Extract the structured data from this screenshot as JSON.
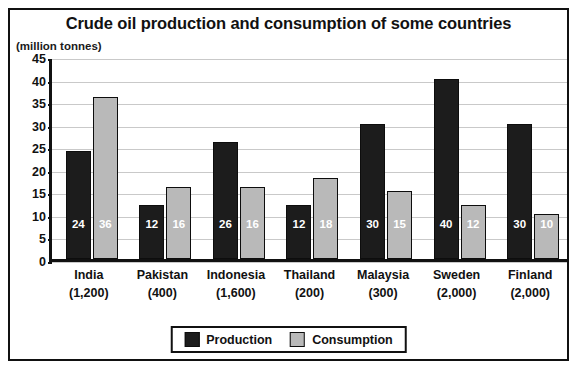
{
  "chart_data": {
    "type": "bar",
    "title": "Crude oil production and consumption of some countries",
    "unit_caption": "(million tonnes)",
    "xlabel": "",
    "ylabel": "",
    "ylim": [
      0,
      45
    ],
    "ytick_step": 5,
    "yticks": [
      "0",
      "5",
      "10",
      "15",
      "20",
      "25",
      "30",
      "35",
      "40",
      "45"
    ],
    "grid": true,
    "legend_position": "bottom-center",
    "categories": [
      "India",
      "Pakistan",
      "Indonesia",
      "Thailand",
      "Malaysia",
      "Sweden",
      "Finland"
    ],
    "category_sublabels": [
      "(1,200)",
      "(400)",
      "(1,600)",
      "(200)",
      "(300)",
      "(2,000)",
      "(2,000)"
    ],
    "series": [
      {
        "name": "Production",
        "color": "#1c1c1c",
        "values": [
          24,
          12,
          26,
          12,
          30,
          40,
          30
        ]
      },
      {
        "name": "Consumption",
        "color": "#b9b9b9",
        "values": [
          36,
          16,
          16,
          18,
          15,
          12,
          10
        ]
      }
    ]
  }
}
